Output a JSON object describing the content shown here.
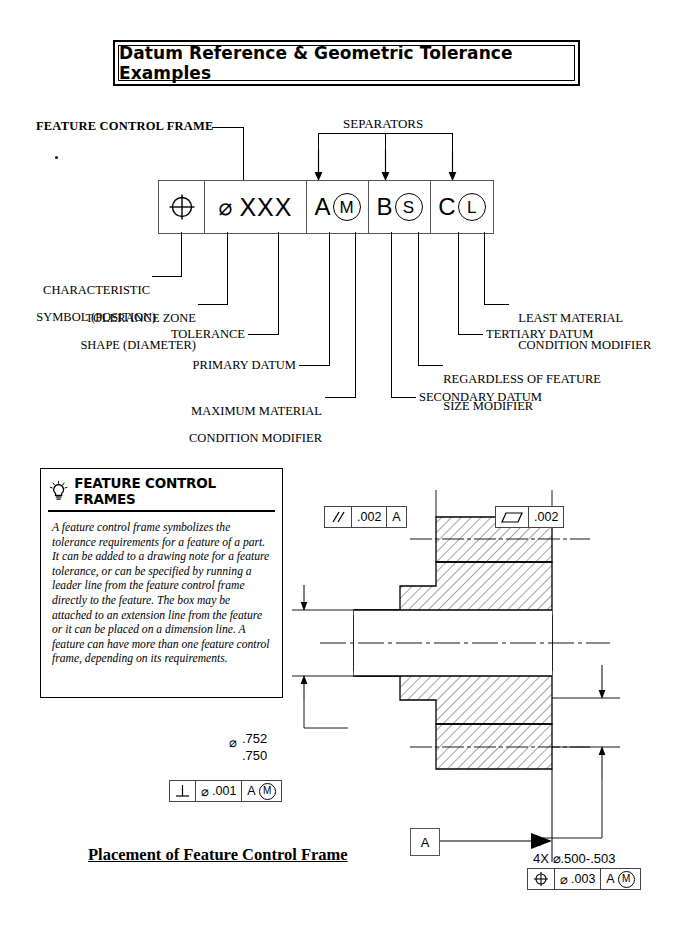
{
  "title": {
    "text": "Datum Reference & Geometric Tolerance Examples"
  },
  "diagram": {
    "top_labels": {
      "feature_control_frame": "FEATURE CONTROL FRAME",
      "separators": "SEPARATORS"
    },
    "frame_cells": {
      "characteristic_symbol": "position-symbol",
      "tolerance_zone_shape": "⌀",
      "tolerance_value": "XXX",
      "primary_datum": "A",
      "primary_modifier": "M",
      "secondary_datum": "B",
      "secondary_modifier": "S",
      "tertiary_datum": "C",
      "tertiary_modifier": "L"
    },
    "callouts": [
      {
        "id": "characteristic-symbol",
        "line1": "CHARACTERISTIC",
        "line2": "SYMBOL (POSITION)"
      },
      {
        "id": "tolerance-zone-shape",
        "line1": "TOLERANCE ZONE",
        "line2": "SHAPE (DIAMETER)"
      },
      {
        "id": "tolerance",
        "line1": "TOLERANCE",
        "line2": ""
      },
      {
        "id": "primary-datum",
        "line1": "PRIMARY DATUM",
        "line2": ""
      },
      {
        "id": "maximum-material-condition-modifier",
        "line1": "MAXIMUM MATERIAL",
        "line2": "CONDITION MODIFIER"
      },
      {
        "id": "secondary-datum",
        "line1": "SECONDARY DATUM",
        "line2": ""
      },
      {
        "id": "regardless-of-feature-size-modifier",
        "line1": "REGARDLESS OF FEATURE",
        "line2": "SIZE MODIFIER"
      },
      {
        "id": "tertiary-datum",
        "line1": "TERTIARY DATUM",
        "line2": ""
      },
      {
        "id": "least-material-condition-modifier",
        "line1": "LEAST MATERIAL",
        "line2": "CONDITION MODIFIER"
      }
    ]
  },
  "info_box": {
    "icon": "lightbulb-icon",
    "heading": "FEATURE CONTROL FRAMES",
    "body": "A feature control frame symbolizes the tolerance requirements for a feature of a part. It can be added to a drawing note for a feature tolerance, or can be specified by running a leader line from the feature control frame directly to the feature. The box may be attached to an extension line from the feature or it can be placed on a dimension line. A feature can have more than one feature control frame, depending on its requirements."
  },
  "drawing": {
    "fcf_parallelism": {
      "symbol": "parallelism-icon",
      "tolerance": ".002",
      "datum": "A"
    },
    "fcf_flatness": {
      "symbol": "flatness-icon",
      "tolerance": ".002"
    },
    "diameter_dimension": {
      "symbol": "⌀",
      "upper": ".752",
      "lower": ".750"
    },
    "fcf_perpendicularity": {
      "symbol": "perpendicularity-icon",
      "diameter": "⌀",
      "tolerance": ".001",
      "datum": "A",
      "modifier": "M"
    },
    "datum_feature": {
      "letter": "A"
    },
    "hole_note": "4X  ⌀.500-.503",
    "fcf_position": {
      "symbol": "position-icon",
      "diameter": "⌀",
      "tolerance": ".003",
      "datum": "A",
      "modifier": "M"
    }
  },
  "bottom_title": {
    "text": "Placement of Feature Control Frame"
  },
  "colors": {
    "ink": "#000000",
    "line": "#555555",
    "paper": "#ffffff"
  }
}
